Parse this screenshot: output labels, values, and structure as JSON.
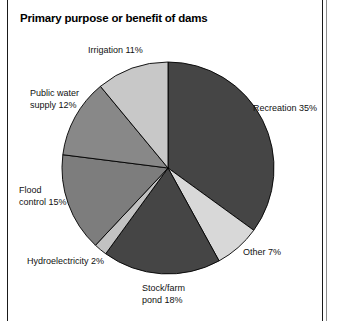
{
  "figure": {
    "title": "Primary purpose or benefit of dams",
    "frame_color": "#1a1a1a",
    "background": "#ffffff"
  },
  "chart_data": {
    "type": "pie",
    "title": "Primary purpose or benefit of dams",
    "xlabel": "",
    "ylabel": "",
    "legend_position": "none",
    "grid": false,
    "units": "percent",
    "start_angle_deg": 0,
    "direction": "clockwise",
    "categories": [
      "Recreation",
      "Other",
      "Stock/farm pond",
      "Hydroelectricity",
      "Flood control",
      "Public water supply",
      "Irrigation"
    ],
    "values": [
      35,
      7,
      18,
      2,
      15,
      12,
      11
    ],
    "labels": [
      "Recreation 35%",
      "Other 7%",
      "Stock/farm\npond 18%",
      "Hydroelectricity 2%",
      "Flood\ncontrol 15%",
      "Public water\nsupply 12%",
      "Irrigation 11%"
    ],
    "colors": [
      "#454545",
      "#d8d8d8",
      "#454545",
      "#c2c2c2",
      "#7d7d7d",
      "#888888",
      "#c8c8c8"
    ],
    "slice_edge_color": "#000000"
  },
  "slices": [
    {
      "key": "recreation",
      "label": "Recreation 35%",
      "value": 35,
      "color": "#454545",
      "label_left": 253,
      "label_top": 103,
      "label_align": "align-left"
    },
    {
      "key": "other",
      "label": "Other 7%",
      "value": 7,
      "color": "#d8d8d8",
      "label_left": 243,
      "label_top": 247,
      "label_align": "align-left"
    },
    {
      "key": "stock-farm-pond",
      "label": "Stock/farm\npond 18%",
      "value": 18,
      "color": "#454545",
      "label_left": 142,
      "label_top": 283,
      "label_align": "align-left"
    },
    {
      "key": "hydroelectricity",
      "label": "Hydroelectricity 2%",
      "value": 2,
      "color": "#c2c2c2",
      "label_left": 27,
      "label_top": 256,
      "label_align": "align-left"
    },
    {
      "key": "flood-control",
      "label": "Flood\ncontrol 15%",
      "value": 15,
      "color": "#7d7d7d",
      "label_left": 19,
      "label_top": 185,
      "label_align": "align-left"
    },
    {
      "key": "public-water-supply",
      "label": "Public water\nsupply 12%",
      "value": 12,
      "color": "#888888",
      "label_left": 30,
      "label_top": 88,
      "label_align": "align-left"
    },
    {
      "key": "irrigation",
      "label": "Irrigation 11%",
      "value": 11,
      "color": "#c8c8c8",
      "label_left": 88,
      "label_top": 45,
      "label_align": "align-left"
    }
  ],
  "geometry": {
    "cx": 168,
    "cy": 168,
    "r": 106
  }
}
